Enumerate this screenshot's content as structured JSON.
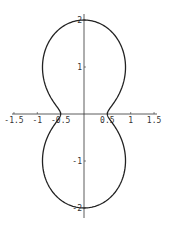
{
  "chart_data": {
    "type": "line",
    "subtype": "polar-curve",
    "title": "",
    "xlabel": "",
    "ylabel": "",
    "xlim": [
      -1.5,
      1.5
    ],
    "ylim": [
      -2.1,
      2.1
    ],
    "grid": false,
    "legend": null,
    "x_ticks": [
      -1.5,
      -1,
      -0.5,
      0.5,
      1,
      1.5
    ],
    "x_tick_labels": [
      "-1.5",
      "-1",
      "-0.5",
      "0.5",
      "1",
      "1.5"
    ],
    "y_ticks": [
      2,
      1,
      -1,
      -2
    ],
    "y_tick_labels": [
      "2",
      "1",
      "-1",
      "-2"
    ],
    "curve": {
      "description": "closed peanut-shaped polar curve, r(theta) = 0.5 + 1.5*sin^2(theta)",
      "key_points": [
        {
          "x": 0,
          "y": 2
        },
        {
          "x": 1.25,
          "y": 0.9
        },
        {
          "x": 0.5,
          "y": 0
        },
        {
          "x": 1.25,
          "y": -0.9
        },
        {
          "x": 0,
          "y": -2
        },
        {
          "x": -1.25,
          "y": -0.9
        },
        {
          "x": -0.5,
          "y": 0
        },
        {
          "x": -1.25,
          "y": 0.9
        }
      ],
      "color": "#222222"
    }
  }
}
